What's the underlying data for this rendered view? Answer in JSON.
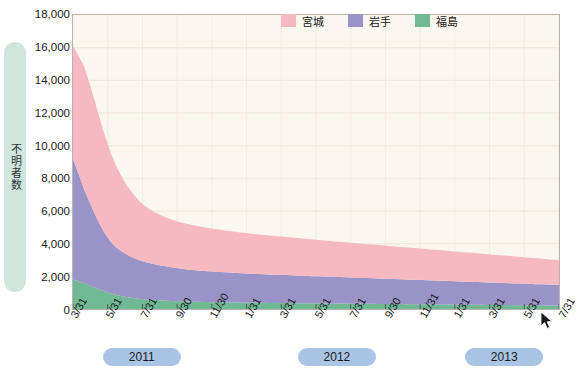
{
  "axis": {
    "y_title": "不明者数",
    "y_ticks": [
      "18,000",
      "16,000",
      "14,000",
      "12,000",
      "10,000",
      "8,000",
      "6,000",
      "4,000",
      "2,000",
      "0"
    ],
    "x_ticks": [
      "3/31",
      "5/31",
      "7/31",
      "9/30",
      "11/30",
      "1/31",
      "3/31",
      "5/31",
      "7/31",
      "9/30",
      "11/31",
      "1/31",
      "3/31",
      "5/31",
      "7/31"
    ]
  },
  "years": [
    {
      "label": "2011"
    },
    {
      "label": "2012"
    },
    {
      "label": "2013"
    }
  ],
  "legend": [
    {
      "label": "宮城",
      "color": "#f6b9c2"
    },
    {
      "label": "岩手",
      "color": "#9a93c7"
    },
    {
      "label": "福島",
      "color": "#6fba95"
    }
  ],
  "colors": {
    "plot_background": "#faf6f0",
    "plot_border": "#b9b3ac",
    "year_pill": "#a9c4e4",
    "ytitle_pill": "#cfe6dc",
    "miyagi": "#f6b9c2",
    "iwate": "#9a93c7",
    "fukushima": "#6fba95"
  },
  "caption": "",
  "chart_data": {
    "type": "area",
    "title": "",
    "subtitle": "",
    "xlabel": "",
    "ylabel": "不明者数",
    "ylim": [
      0,
      18000
    ],
    "grid": true,
    "legend_position": "top-right",
    "stacked": true,
    "x_tick_labels": [
      "3/31",
      "5/31",
      "7/31",
      "9/30",
      "11/30",
      "1/31",
      "3/31",
      "5/31",
      "7/31",
      "9/30",
      "11/31",
      "1/31",
      "3/31",
      "5/31",
      "7/31"
    ],
    "x_tick_years": [
      "2011",
      "2011",
      "2011",
      "2011",
      "2011",
      "2012",
      "2012",
      "2012",
      "2012",
      "2012",
      "2012",
      "2013",
      "2013",
      "2013",
      "2013"
    ],
    "x": [
      0,
      1,
      2,
      3,
      4,
      5,
      6,
      7,
      8,
      9,
      10,
      11,
      12,
      13,
      14,
      15,
      16,
      17,
      18,
      19,
      20,
      21,
      22,
      23,
      24,
      25,
      26,
      27,
      28,
      29,
      30,
      31,
      32,
      33,
      34,
      35,
      36,
      37,
      38,
      39,
      40,
      41,
      42,
      43,
      44,
      45,
      46,
      47,
      48,
      49,
      50,
      51,
      52,
      53,
      54,
      55,
      56,
      57,
      58,
      59,
      60,
      61,
      62,
      63,
      64,
      65,
      66,
      67,
      68,
      69,
      70,
      71,
      72,
      73,
      74,
      75,
      76,
      77,
      78,
      79,
      80,
      81,
      82,
      83,
      84,
      85,
      86,
      87,
      88,
      89
    ],
    "series": [
      {
        "name": "福島",
        "color": "#6fba95",
        "values": [
          1800,
          1700,
          1580,
          1450,
          1320,
          1180,
          1050,
          940,
          850,
          780,
          720,
          670,
          630,
          600,
          575,
          550,
          530,
          510,
          495,
          480,
          468,
          456,
          446,
          437,
          429,
          422,
          415,
          409,
          403,
          398,
          393,
          389,
          385,
          381,
          378,
          375,
          372,
          369,
          366,
          363,
          360,
          357,
          354,
          351,
          348,
          345,
          342,
          339,
          336,
          333,
          330,
          327,
          324,
          321,
          318,
          315,
          312,
          309,
          306,
          303,
          300,
          297,
          294,
          291,
          288,
          285,
          282,
          279,
          276,
          273,
          270,
          267,
          264,
          261,
          258,
          255,
          252,
          249,
          246,
          243,
          240,
          237,
          234,
          231,
          228,
          225,
          222,
          219,
          216,
          213
        ]
      },
      {
        "name": "岩手",
        "color": "#9a93c7",
        "values": [
          7400,
          6600,
          5800,
          5100,
          4500,
          3950,
          3500,
          3150,
          2900,
          2720,
          2580,
          2470,
          2380,
          2300,
          2240,
          2190,
          2140,
          2100,
          2060,
          2025,
          1995,
          1970,
          1945,
          1925,
          1905,
          1888,
          1870,
          1855,
          1840,
          1826,
          1812,
          1800,
          1788,
          1776,
          1765,
          1754,
          1744,
          1734,
          1724,
          1714,
          1704,
          1694,
          1684,
          1674,
          1664,
          1655,
          1646,
          1637,
          1628,
          1619,
          1610,
          1601,
          1592,
          1583,
          1574,
          1565,
          1556,
          1547,
          1538,
          1529,
          1520,
          1511,
          1502,
          1493,
          1484,
          1475,
          1466,
          1457,
          1448,
          1439,
          1430,
          1421,
          1412,
          1403,
          1394,
          1385,
          1376,
          1367,
          1358,
          1349,
          1340,
          1331,
          1322,
          1313,
          1304,
          1295,
          1286,
          1277,
          1268,
          1259
        ]
      },
      {
        "name": "宮城",
        "color": "#f6b9c2",
        "values": [
          6900,
          7200,
          7500,
          7300,
          6900,
          6400,
          5900,
          5400,
          4950,
          4550,
          4200,
          3900,
          3650,
          3450,
          3300,
          3180,
          3080,
          3000,
          2930,
          2870,
          2820,
          2780,
          2740,
          2705,
          2672,
          2640,
          2610,
          2582,
          2555,
          2530,
          2506,
          2483,
          2461,
          2440,
          2420,
          2400,
          2380,
          2362,
          2344,
          2326,
          2308,
          2290,
          2273,
          2256,
          2239,
          2222,
          2206,
          2190,
          2174,
          2158,
          2142,
          2126,
          2110,
          2094,
          2078,
          2062,
          2046,
          2030,
          2014,
          1998,
          1982,
          1966,
          1950,
          1934,
          1918,
          1902,
          1886,
          1870,
          1854,
          1838,
          1822,
          1806,
          1790,
          1774,
          1758,
          1742,
          1726,
          1710,
          1694,
          1678,
          1662,
          1646,
          1630,
          1614,
          1598,
          1582,
          1566,
          1550,
          1534,
          1518
        ]
      }
    ]
  }
}
